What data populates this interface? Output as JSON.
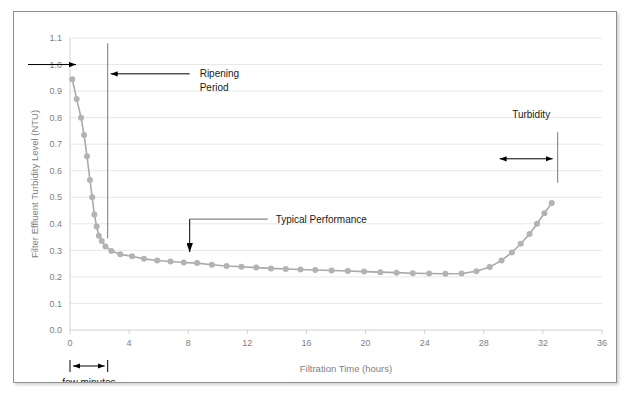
{
  "figure": {
    "border_color": "#8f8f8f",
    "background": "#ffffff"
  },
  "chart_data": {
    "type": "line",
    "title": "",
    "xlabel": "Filtration Time (hours)",
    "ylabel": "Filter Effluent Turbidity Level (NTU)",
    "xlim": [
      0,
      36
    ],
    "ylim": [
      0.0,
      1.1
    ],
    "xticks": [
      0,
      4,
      8,
      12,
      16,
      20,
      24,
      28,
      32,
      36
    ],
    "xtick_labels": [
      "0",
      "4",
      "8",
      "12",
      "16",
      "20",
      "24",
      "28",
      "32",
      "36"
    ],
    "yticks": [
      0.0,
      0.1,
      0.2,
      0.3,
      0.4,
      0.5,
      0.6,
      0.7,
      0.8,
      0.9,
      1.0,
      1.1
    ],
    "ytick_labels": [
      "0.0",
      "0.1",
      "0.2",
      "0.3",
      "0.4",
      "0.5",
      "0.6",
      "0.7",
      "0.8",
      "0.9",
      "1.0",
      "1.1"
    ],
    "grid": "horizontal-light",
    "legend": "none",
    "line_color": "#a9a9a9",
    "marker_color": "#b3b3b3",
    "marker_size": 3.0,
    "series": [
      {
        "name": "Filter Effluent Turbidity",
        "x": [
          0.15,
          0.45,
          0.75,
          0.95,
          1.15,
          1.35,
          1.5,
          1.65,
          1.8,
          1.95,
          2.15,
          2.4,
          2.8,
          3.4,
          4.2,
          5.0,
          5.9,
          6.8,
          7.7,
          8.6,
          9.6,
          10.6,
          11.6,
          12.6,
          13.6,
          14.6,
          15.6,
          16.6,
          17.7,
          18.8,
          19.9,
          21.0,
          22.1,
          23.2,
          24.3,
          25.4,
          26.5,
          27.5,
          28.4,
          29.2,
          29.9,
          30.5,
          31.1,
          31.6,
          32.1,
          32.6
        ],
        "y": [
          0.945,
          0.87,
          0.8,
          0.735,
          0.655,
          0.565,
          0.5,
          0.435,
          0.39,
          0.355,
          0.335,
          0.315,
          0.298,
          0.285,
          0.278,
          0.268,
          0.262,
          0.258,
          0.254,
          0.252,
          0.246,
          0.241,
          0.238,
          0.235,
          0.232,
          0.23,
          0.228,
          0.226,
          0.224,
          0.222,
          0.22,
          0.218,
          0.216,
          0.214,
          0.213,
          0.212,
          0.213,
          0.221,
          0.237,
          0.262,
          0.292,
          0.325,
          0.362,
          0.4,
          0.44,
          0.478
        ]
      }
    ]
  },
  "annotations": {
    "inflow_arrow": {
      "name": "influent-level-arrow",
      "y_value": 1.0,
      "label": ""
    },
    "ripening": {
      "label_line1": "Ripening",
      "label_line2": "Period",
      "vline_x": 2.55,
      "vline_y_top": 1.08,
      "vline_y_bottom": 0.345
    },
    "typical_performance": {
      "label": "Typical Performance",
      "target_x": 8.1,
      "target_y": 0.252
    },
    "turbidity": {
      "label": "Turbidity",
      "vline_x": 33.0,
      "vline_y_top": 0.745,
      "vline_y_bottom": 0.555,
      "arrow_left_x": 28.6,
      "arrow_y": 0.645
    },
    "few_minutes": {
      "label": "few minutes",
      "from_x": 0.0,
      "to_x": 2.55
    }
  }
}
